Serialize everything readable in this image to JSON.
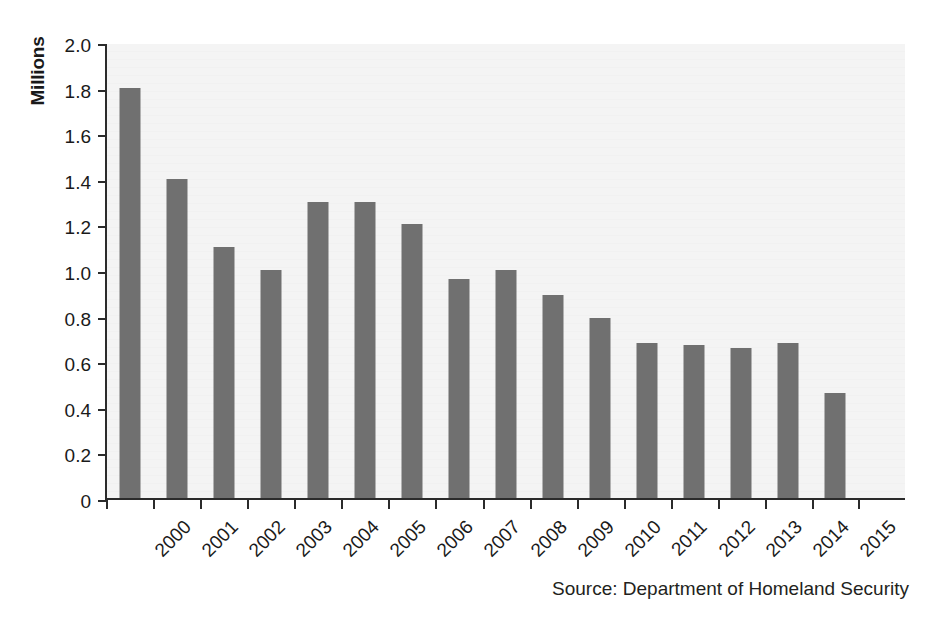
{
  "chart_data": {
    "type": "bar",
    "title": "",
    "subtitle": "",
    "xlabel": "",
    "ylabel": "Millions",
    "ylim": [
      0,
      2.0
    ],
    "y_ticks": [
      "0",
      "0.2",
      "0.4",
      "0.6",
      "0.8",
      "1.0",
      "1.2",
      "1.4",
      "1.6",
      "1.8",
      "2.0"
    ],
    "y_tick_values": [
      0,
      0.2,
      0.4,
      0.6,
      0.8,
      1.0,
      1.2,
      1.4,
      1.6,
      1.8,
      2.0
    ],
    "grid": false,
    "legend": "none",
    "categories": [
      "2000",
      "2001",
      "2002",
      "2003",
      "2004",
      "2005",
      "2006",
      "2007",
      "2008",
      "2009",
      "2010",
      "2011",
      "2012",
      "2013",
      "2014",
      "2015"
    ],
    "values": [
      1.8,
      1.4,
      1.1,
      1.0,
      1.3,
      1.3,
      1.2,
      0.96,
      1.0,
      0.89,
      0.79,
      0.68,
      0.67,
      0.66,
      0.68,
      0.46
    ],
    "series": [
      {
        "name": "Apprehensions",
        "values": [
          1.8,
          1.4,
          1.1,
          1.0,
          1.3,
          1.3,
          1.2,
          0.96,
          1.0,
          0.89,
          0.79,
          0.68,
          0.67,
          0.66,
          0.68,
          0.46
        ]
      }
    ],
    "bar_color": "#707070",
    "plot_background": "#f4f4f4",
    "axis_color": "#2b2b2b",
    "annotations": []
  },
  "source_note": "Source: Department of Homeland Security"
}
